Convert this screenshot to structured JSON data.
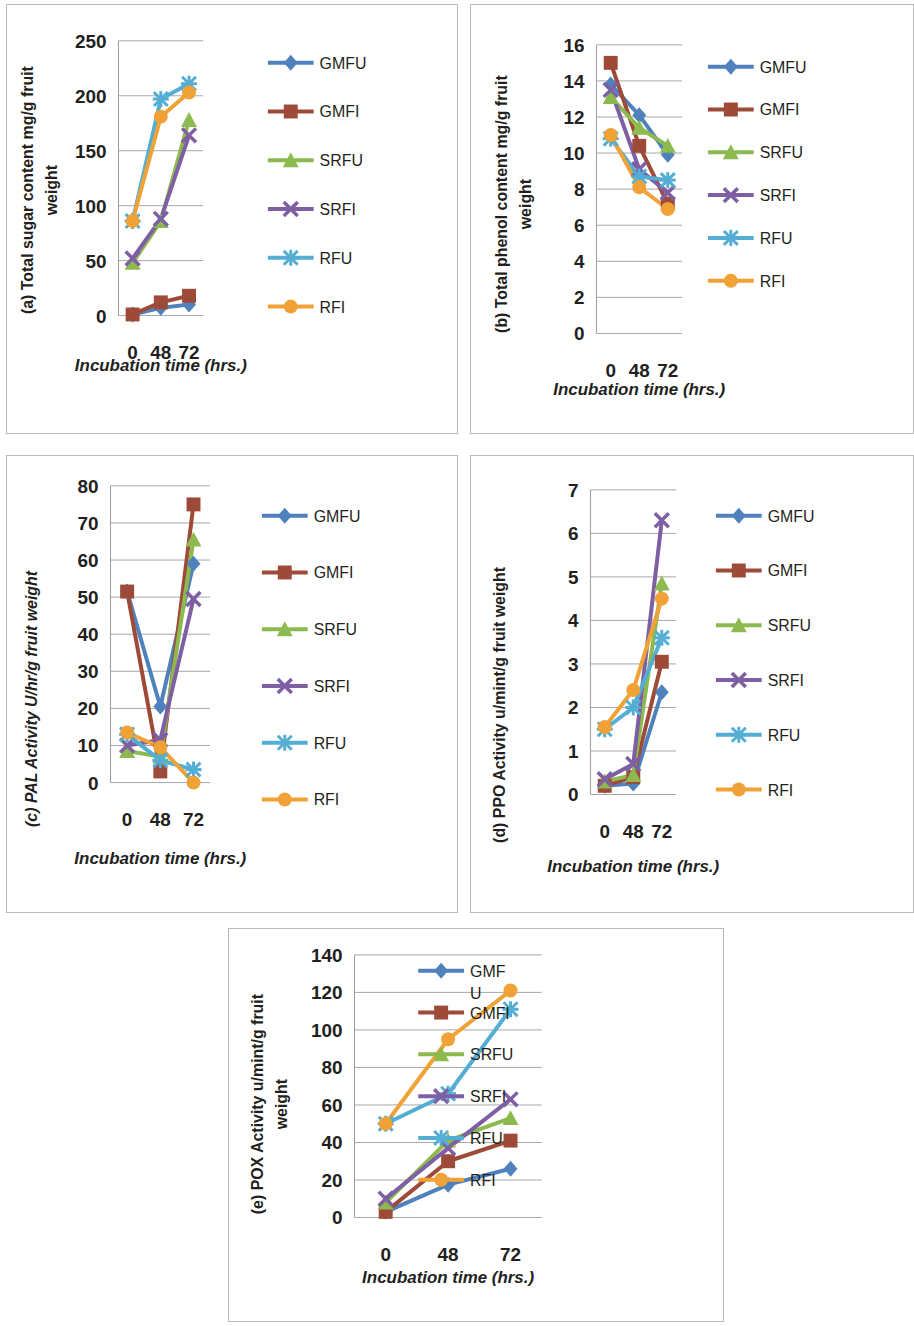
{
  "figure": {
    "shared_xlabel": "Incubation time (hrs.)",
    "categories": [
      "0",
      "48",
      "72"
    ],
    "series_names": [
      "GMFU",
      "GMFI",
      "SRFU",
      "SRFI",
      "RFU",
      "RFI"
    ],
    "colors": {
      "GMFU": "#4f81bd",
      "GMFI": "#9e4a38",
      "SRFU": "#8dba4e",
      "SRFI": "#7f5fa4",
      "RFU": "#54aed4",
      "RFI": "#f0a236"
    },
    "markers": {
      "GMFU": "diamond",
      "GMFI": "square",
      "SRFU": "triangle",
      "SRFI": "x",
      "RFU": "star",
      "RFI": "circle"
    }
  },
  "chart_data": [
    {
      "id": "a",
      "type": "line",
      "title": "(a) Total sugar content mg/g fruit weight",
      "ylabel_lines": [
        "(a) Total sugar content mg/g fruit",
        "weight"
      ],
      "xlabel": "Incubation time (hrs.)",
      "categories": [
        "0",
        "48",
        "72"
      ],
      "x": [
        0,
        48,
        72
      ],
      "ylim": [
        0,
        250
      ],
      "yticks": [
        0,
        50,
        100,
        150,
        200,
        250
      ],
      "ytick_labels": [
        "0",
        "50",
        "100",
        "150",
        "200",
        "250"
      ],
      "grid": true,
      "legend_position": "right",
      "series": [
        {
          "name": "GMFU",
          "values": [
            1,
            7,
            10
          ]
        },
        {
          "name": "GMFI",
          "values": [
            1,
            12,
            18
          ]
        },
        {
          "name": "SRFU",
          "values": [
            48,
            86,
            178
          ]
        },
        {
          "name": "SRFI",
          "values": [
            52,
            88,
            164
          ]
        },
        {
          "name": "RFU",
          "values": [
            86,
            197,
            211
          ]
        },
        {
          "name": "RFI",
          "values": [
            86,
            181,
            203
          ]
        }
      ]
    },
    {
      "id": "b",
      "type": "line",
      "title": "(b) Total phenol content mg/g fruit weight",
      "ylabel_lines": [
        "(b) Total phenol content mg/g fruit",
        "weight"
      ],
      "xlabel": "Incubation time (hrs.)",
      "categories": [
        "0",
        "48",
        "72"
      ],
      "x": [
        0,
        48,
        72
      ],
      "ylim": [
        0,
        16
      ],
      "yticks": [
        0,
        2,
        4,
        6,
        8,
        10,
        12,
        14,
        16
      ],
      "ytick_labels": [
        "0",
        "2",
        "4",
        "6",
        "8",
        "10",
        "12",
        "14",
        "16"
      ],
      "grid": true,
      "legend_position": "right",
      "series": [
        {
          "name": "GMFU",
          "values": [
            13.8,
            12.1,
            9.9
          ]
        },
        {
          "name": "GMFI",
          "values": [
            15.0,
            10.4,
            7.2
          ]
        },
        {
          "name": "SRFU",
          "values": [
            13.1,
            11.4,
            10.4
          ]
        },
        {
          "name": "SRFI",
          "values": [
            13.5,
            9.1,
            7.8
          ]
        },
        {
          "name": "RFU",
          "values": [
            10.8,
            8.7,
            8.5
          ]
        },
        {
          "name": "RFI",
          "values": [
            11.0,
            8.1,
            6.9
          ]
        }
      ]
    },
    {
      "id": "c",
      "type": "line",
      "title": "(c) PAL Activity U/hr/g fruit weight",
      "ylabel_lines": [
        "(c) PAL Activity U/hr/g fruit weight"
      ],
      "ylabel_italic": true,
      "xlabel": "Incubation time (hrs.)",
      "categories": [
        "0",
        "48",
        "72"
      ],
      "x": [
        0,
        48,
        72
      ],
      "ylim": [
        0,
        80
      ],
      "yticks": [
        0,
        10,
        20,
        30,
        40,
        50,
        60,
        70,
        80
      ],
      "ytick_labels": [
        "0",
        "10",
        "20",
        "30",
        "40",
        "50",
        "60",
        "70",
        "80"
      ],
      "grid": true,
      "legend_position": "right",
      "series": [
        {
          "name": "GMFU",
          "values": [
            51.5,
            20.5,
            59.0
          ]
        },
        {
          "name": "GMFI",
          "values": [
            51.5,
            3.0,
            75.0
          ]
        },
        {
          "name": "SRFU",
          "values": [
            8.5,
            7.0,
            65.5
          ]
        },
        {
          "name": "SRFI",
          "values": [
            10.0,
            11.5,
            49.5
          ]
        },
        {
          "name": "RFU",
          "values": [
            13.0,
            6.0,
            3.5
          ]
        },
        {
          "name": "RFI",
          "values": [
            13.5,
            9.5,
            0.0
          ]
        }
      ]
    },
    {
      "id": "d",
      "type": "line",
      "title": "(d) PPO Activity u/mint/g fruit weight",
      "ylabel_lines": [
        "(d) PPO Activity u/mint/g fruit weight"
      ],
      "xlabel": "Incubation time (hrs.)",
      "categories": [
        "0",
        "48",
        "72"
      ],
      "x": [
        0,
        48,
        72
      ],
      "ylim": [
        0,
        7
      ],
      "yticks": [
        0,
        1,
        2,
        3,
        4,
        5,
        6,
        7
      ],
      "ytick_labels": [
        "0",
        "1",
        "2",
        "3",
        "4",
        "5",
        "6",
        "7"
      ],
      "grid": true,
      "legend_position": "right",
      "series": [
        {
          "name": "GMFU",
          "values": [
            0.2,
            0.25,
            2.35
          ]
        },
        {
          "name": "GMFI",
          "values": [
            0.2,
            0.4,
            3.05
          ]
        },
        {
          "name": "SRFU",
          "values": [
            0.3,
            0.45,
            4.85
          ]
        },
        {
          "name": "SRFI",
          "values": [
            0.35,
            0.7,
            6.3
          ]
        },
        {
          "name": "RFU",
          "values": [
            1.5,
            2.0,
            3.6
          ]
        },
        {
          "name": "RFI",
          "values": [
            1.55,
            2.4,
            4.5
          ]
        }
      ]
    },
    {
      "id": "e",
      "type": "line",
      "title": "(e) POX Activity u/mint/g fruit weight",
      "ylabel_lines": [
        "(e) POX Activity u/mint/g fruit",
        "weight"
      ],
      "xlabel": "Incubation time (hrs.)",
      "categories": [
        "0",
        "48",
        "72"
      ],
      "x": [
        0,
        48,
        72
      ],
      "ylim": [
        0,
        140
      ],
      "yticks": [
        0,
        20,
        40,
        60,
        80,
        100,
        120,
        140
      ],
      "ytick_labels": [
        "0",
        "20",
        "40",
        "60",
        "80",
        "100",
        "120",
        "140"
      ],
      "grid": true,
      "legend_position": "right",
      "legend_labels": [
        "GMF U",
        "GMFI",
        "SRFU",
        "SRFI",
        "RFU",
        "RFI"
      ],
      "series": [
        {
          "name": "GMFU",
          "values": [
            3,
            17.5,
            26
          ]
        },
        {
          "name": "GMFI",
          "values": [
            3,
            30,
            41
          ]
        },
        {
          "name": "SRFU",
          "values": [
            8,
            41,
            53
          ]
        },
        {
          "name": "SRFI",
          "values": [
            10,
            37,
            63
          ]
        },
        {
          "name": "RFU",
          "values": [
            50,
            66,
            111
          ]
        },
        {
          "name": "RFI",
          "values": [
            50,
            95,
            121
          ]
        }
      ]
    }
  ]
}
